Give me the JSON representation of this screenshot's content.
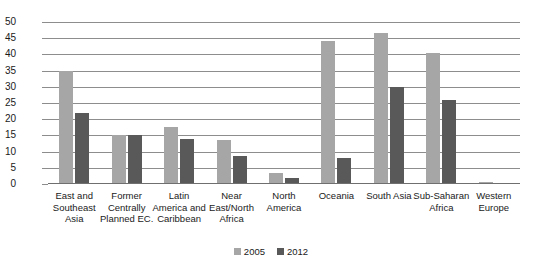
{
  "chart_data": {
    "type": "bar",
    "title": "",
    "subtitle": "",
    "xlabel": "",
    "ylabel": "",
    "ylim": [
      0,
      50
    ],
    "ytick_step": 5,
    "yticks": [
      50,
      45,
      40,
      35,
      30,
      25,
      20,
      15,
      10,
      5,
      0
    ],
    "grid": true,
    "legend_position": "bottom",
    "categories": [
      "East and Southeast Asia",
      "Former Centrally Planned EC.",
      "Latin America and Caribbean",
      "Near East/North Africa",
      "North America",
      "Oceania",
      "South Asia",
      "Sub-Saharan Africa",
      "Western Europe"
    ],
    "category_lines": [
      [
        "East and",
        "Southeast",
        "Asia"
      ],
      [
        "Former",
        "Centrally",
        "Planned EC."
      ],
      [
        "Latin",
        "America and",
        "Caribbean"
      ],
      [
        "Near",
        "East/North",
        "Africa"
      ],
      [
        "North",
        "America"
      ],
      [
        "Oceania"
      ],
      [
        "South Asia"
      ],
      [
        "Sub-Saharan",
        "Africa"
      ],
      [
        "Western",
        "Europe"
      ]
    ],
    "series": [
      {
        "name": "2005",
        "color": "#a6a6a6",
        "values": [
          35,
          15,
          17.5,
          13.5,
          3.5,
          44,
          46.5,
          40.5,
          0.5
        ]
      },
      {
        "name": "2012",
        "color": "#595959",
        "values": [
          22,
          15,
          14,
          8.5,
          2,
          8,
          30,
          26,
          0
        ]
      }
    ]
  },
  "legend": {
    "entries": [
      {
        "label": "2005",
        "color": "#a6a6a6"
      },
      {
        "label": "2012",
        "color": "#595959"
      }
    ]
  },
  "colors": {
    "series_2005": "#a6a6a6",
    "series_2012": "#595959",
    "gridline": "#8d8d8d",
    "text": "#1a1a1a",
    "background": "#ffffff"
  }
}
